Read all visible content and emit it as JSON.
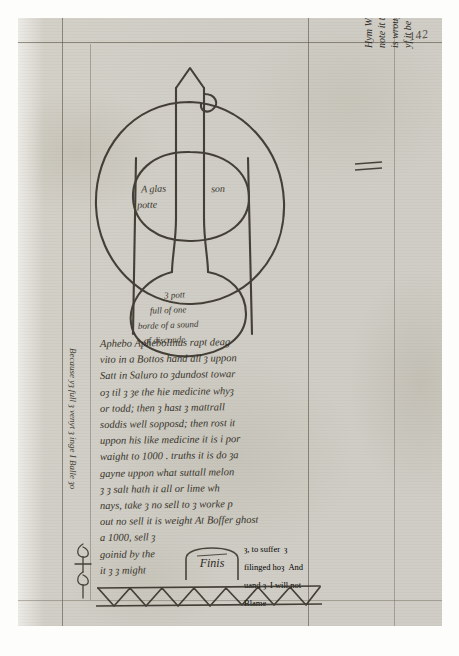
{
  "document": {
    "type": "handwritten-manuscript-leaf",
    "folio_number": "142",
    "ink_color": "#2d2920",
    "paper_color": "#cfcdc5",
    "rule_color": "#5e5547"
  },
  "diagram": {
    "name": "alchemical-glass-vessel",
    "caption_upper_left": "A glas",
    "caption_upper_left_2": "potte",
    "caption_upper_right": "son",
    "flask_lines": [
      "3 pott",
      "full of one",
      "borde of a sound",
      "of disconde"
    ]
  },
  "body_text": {
    "lines": [
      "Aphebo Aphebolinus rapt deag",
      "vito in a Bottos hand all ȝ uppon",
      "Satt in Saluro to ȝdundost towar",
      "oȝ til ȝ ȝe the hie medicine whyȝ",
      "or todd; then ȝ hast ȝ mattrall",
      "soddis well sopposd; then rost it",
      "uppon his like medicine it is i por",
      "waight to 1000 . truths it is do ȝa",
      "gayne uppon what suttall melon",
      "ȝ ȝ salt hath it all or lime wh",
      "nays, take ȝ no sell to ȝ worke p",
      "out no sell it is weight At Boffer ghost",
      "a 1000, sell ȝ",
      "goinid by the",
      "it ȝ ȝ might"
    ],
    "right_tail_lines": [
      "ȝ, to suffer",
      "ȝ filinged hoȝ",
      "And uand ȝ",
      "I will not Blame"
    ]
  },
  "right_margin_note": {
    "lines": [
      "yf it be not the phord crow is the lyth — Zozym ȝ ȝe yȝ it",
      "is wrought ȝ ȝe ȝn that is of it any that inage is or that ȝe worke oȝ ȝ",
      "note it thus ȝ ȝ ȝ ȝe proȝ ghe hath ȝnd",
      "Hym Wroht ="
    ]
  },
  "left_margin_note": {
    "text": "Because yȝ full ȝ venyt ȝ inge I Balle ȝo"
  },
  "finis": {
    "label": "Finis"
  },
  "ornament": {
    "name": "zigzag-lattice-border",
    "description": "triangular lattice border across foot of text block"
  }
}
